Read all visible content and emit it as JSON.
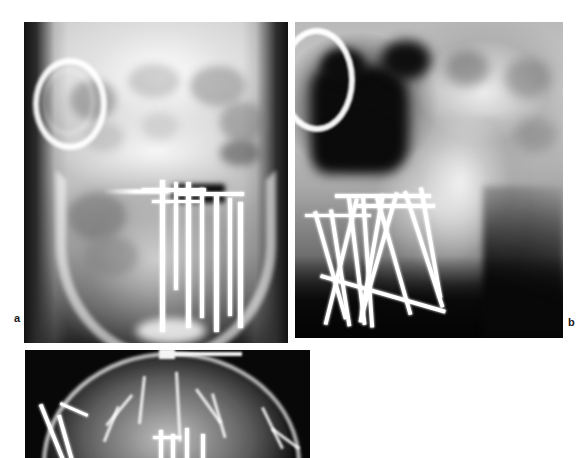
{
  "figure": {
    "type": "radiograph-plate",
    "background_color": "#ffffff",
    "panel_count": 3,
    "scan_artifact_text": "· ·    ·",
    "panels": [
      {
        "id": "a",
        "label": "a",
        "view": "anteroposterior-skull-mandible",
        "description": "AP radiograph of skull and mandible showing vertical endosseous implants with horizontal connecting bars in the mandibular body; radiopaque ring marker overlying the left orbit.",
        "label_position": {
          "x": 16,
          "y": 318
        },
        "rect": {
          "x": 24,
          "y": 22,
          "width": 264,
          "height": 321
        },
        "implants": {
          "posts": 7,
          "cross_bars": 3,
          "material_appearance": "radiopaque-white"
        },
        "markers": [
          "circular-ring-marker"
        ]
      },
      {
        "id": "b",
        "label": "b",
        "view": "lateral-skull-mandible",
        "description": "Lateral radiograph showing crisscrossing transosseous implant pins and horizontal retention bars in the anterior mandible.",
        "label_position": {
          "x": 568,
          "y": 322
        },
        "rect": {
          "x": 295,
          "y": 22,
          "width": 268,
          "height": 316
        },
        "implants": {
          "posts": 10,
          "cross_bars": 3,
          "material_appearance": "radiopaque-white"
        },
        "markers": [
          "circular-ring-marker"
        ]
      },
      {
        "id": "c",
        "label": "c",
        "view": "submentovertex-axial-skull",
        "description": "Submentovertex projection of the cranial vault, cropped at the lower page margin, with implant hardware projecting over the midline.",
        "label_position": null,
        "rect": {
          "x": 25,
          "y": 350,
          "width": 285,
          "height": 108
        },
        "implants": {
          "posts": 4,
          "cross_bars": 0,
          "material_appearance": "radiopaque-white"
        },
        "markers": []
      }
    ],
    "colors": {
      "page": "#ffffff",
      "film_dark": "#0b0b0b",
      "bone_bright": "#ffffff",
      "label_text": "#1a1a1a"
    }
  }
}
